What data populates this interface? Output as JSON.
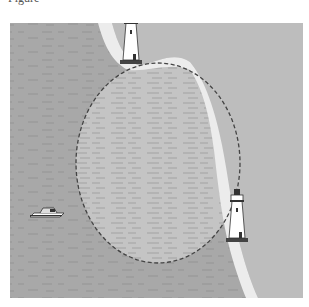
{
  "caption": "Figure",
  "figure": {
    "colors": {
      "sea": "#a8a8a8",
      "land": "#bdbdbd",
      "beach": "#ececec",
      "circle_fill": "#c4c4c4",
      "circle_stroke": "#444444",
      "lighthouse_body": "#ffffff",
      "lighthouse_outline": "#333333"
    },
    "lighthouses": [
      {
        "name": "north-lighthouse",
        "base_x": 131,
        "base_y": 63
      },
      {
        "name": "east-lighthouse",
        "base_x": 237,
        "base_y": 241
      }
    ],
    "boat": {
      "x": 44,
      "y": 212
    },
    "danger_circle": {
      "cx": 158,
      "cy": 163,
      "rx": 82,
      "ry": 100,
      "style": "dashed"
    }
  }
}
